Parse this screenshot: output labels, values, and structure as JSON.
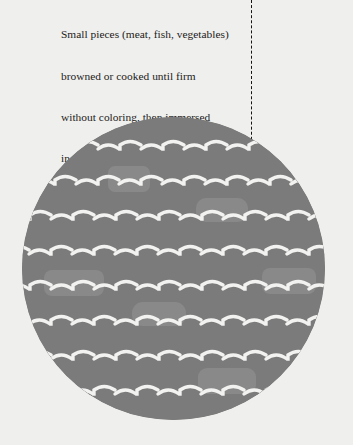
{
  "colors": {
    "background": "#efefed",
    "illustration_fill": "#7b7b7b",
    "wave_stroke": "#f2f2f0",
    "patch_fill": "#898989",
    "leader": "#15140f",
    "text": "#1c1b1a"
  },
  "annotation": {
    "lines": [
      "Small pieces (meat, fish, vegetables)",
      "browned or cooked until firm",
      "without coloring, then immersed",
      "in a liquid thickened with flour,",
      "covered, and cooked"
    ],
    "full_text": "Small pieces (meat, fish, vegetables) browned or cooked until firm without coloring, then immersed in a liquid thickened with flour, covered, and cooked",
    "leader": {
      "style": "dashed",
      "marker": "filled-dot"
    }
  },
  "illustration": {
    "shape": "circle",
    "motif": "wavy-liquid-surface",
    "wave_rows": 9,
    "row_spacing": 35,
    "wave_width": 43,
    "patches": [
      {
        "x": 108,
        "y": 166,
        "w": 42,
        "h": 26
      },
      {
        "x": 196,
        "y": 198,
        "w": 52,
        "h": 24
      },
      {
        "x": 44,
        "y": 270,
        "w": 60,
        "h": 26
      },
      {
        "x": 262,
        "y": 268,
        "w": 54,
        "h": 26
      },
      {
        "x": 132,
        "y": 302,
        "w": 54,
        "h": 24
      },
      {
        "x": 198,
        "y": 368,
        "w": 58,
        "h": 26
      }
    ]
  }
}
